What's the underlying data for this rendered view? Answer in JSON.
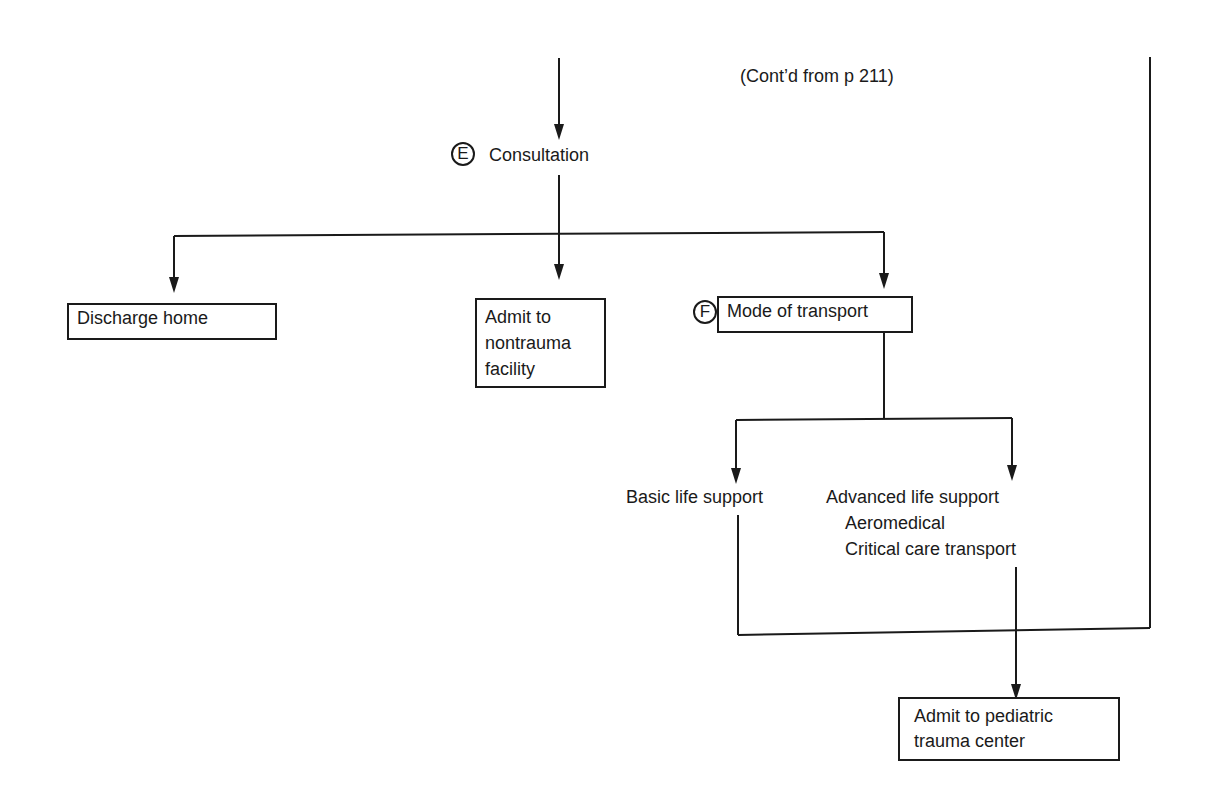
{
  "header": {
    "continuation_note": "(Cont’d from p 211)"
  },
  "nodes": {
    "consultation": {
      "marker": "E",
      "label": "Consultation"
    },
    "discharge_home": {
      "label": "Discharge home"
    },
    "admit_nontrauma": {
      "lines": [
        "Admit to",
        "nontrauma",
        "facility"
      ]
    },
    "mode_of_transport": {
      "marker": "F",
      "label": "Mode of transport"
    },
    "basic_life_support": {
      "label": "Basic life support"
    },
    "advanced_life_support": {
      "label": "Advanced life support",
      "sub_items": [
        "Aeromedical",
        "Critical care transport"
      ]
    },
    "admit_pediatric": {
      "lines": [
        "Admit to pediatric",
        "trauma center"
      ]
    }
  },
  "colors": {
    "ink": "#1a1a1a",
    "background": "#ffffff"
  }
}
